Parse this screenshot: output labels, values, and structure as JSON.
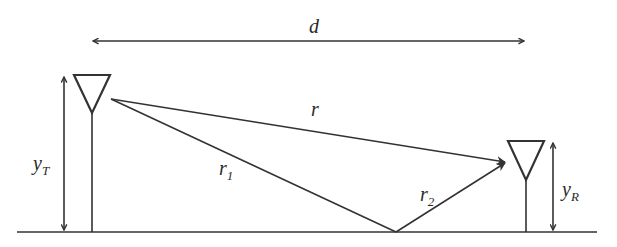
{
  "diagram": {
    "labels": {
      "distance": "d",
      "direct_path": "r",
      "incident_path": "r",
      "incident_sub": "1",
      "reflected_path": "r",
      "reflected_sub": "2",
      "tx_height": "y",
      "tx_height_sub": "T",
      "rx_height": "y",
      "rx_height_sub": "R"
    },
    "elements": [
      {
        "id": "transmitter-antenna",
        "type": "antenna"
      },
      {
        "id": "receiver-antenna",
        "type": "antenna"
      },
      {
        "id": "ground-plane",
        "type": "line"
      },
      {
        "id": "direct-ray",
        "type": "arrow",
        "label": "r"
      },
      {
        "id": "incident-ray",
        "type": "line",
        "label": "r1"
      },
      {
        "id": "reflected-ray",
        "type": "arrow",
        "label": "r2"
      },
      {
        "id": "distance-dimension",
        "type": "double-arrow",
        "label": "d"
      },
      {
        "id": "tx-height-dimension",
        "type": "double-arrow",
        "label": "yT"
      },
      {
        "id": "rx-height-dimension",
        "type": "double-arrow",
        "label": "yR"
      }
    ],
    "colors": {
      "stroke": "#333333",
      "text": "#2a2a2a",
      "background": "#ffffff"
    }
  }
}
